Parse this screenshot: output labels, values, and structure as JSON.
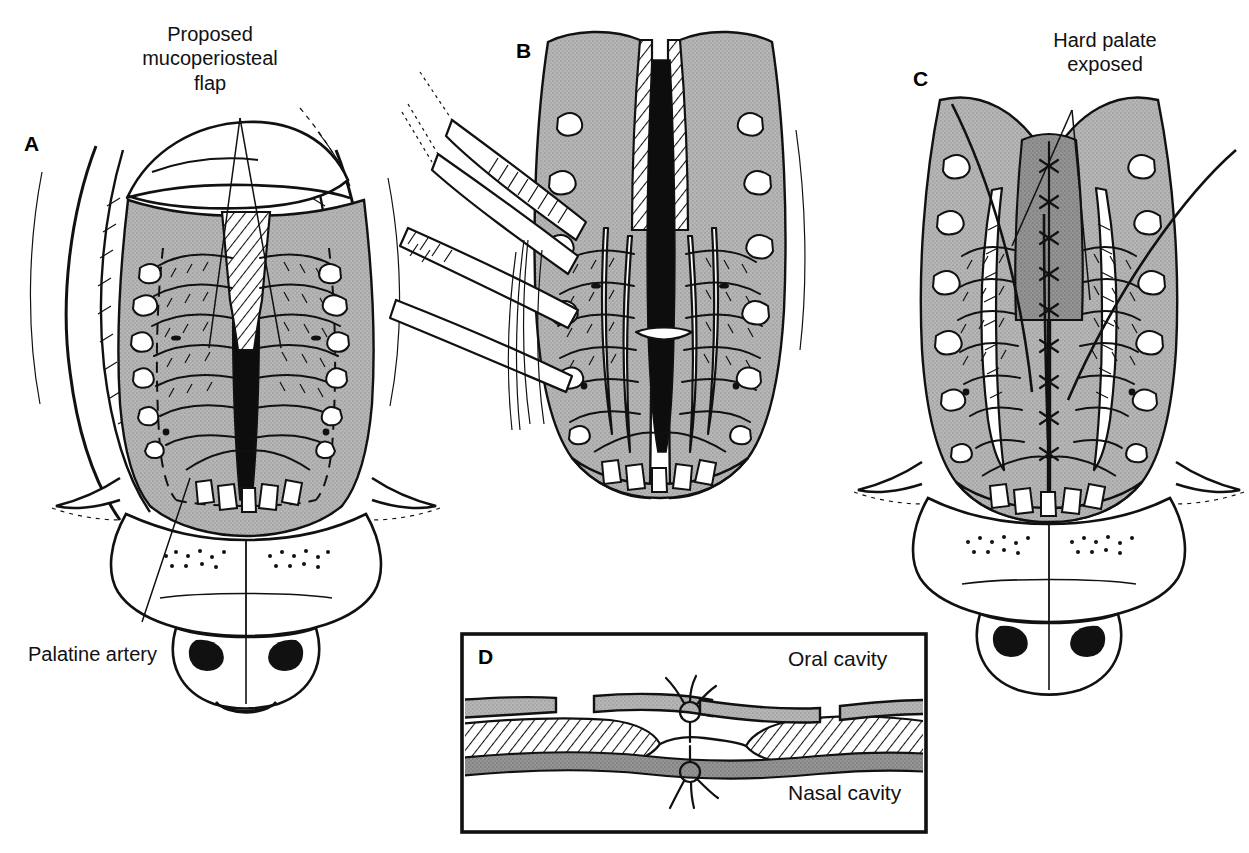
{
  "plate": {
    "width": 1249,
    "height": 853,
    "background": "#ffffff",
    "ink_color": "#111111",
    "mucosa_gray": "#b0b0b0",
    "mucosa_dark_gray": "#8f8f8f",
    "subject": "Cleft palate repair — two-flap (von Langenbeck / Bardach) palatoplasty, four-stage surgical plate"
  },
  "panels": [
    {
      "id": "A",
      "letter": "A",
      "letter_x": 24,
      "letter_y": 133,
      "caption": "Incision design on the cleft palate",
      "callouts": [
        {
          "name": "proposed-mucoperiosteal-flap",
          "text": "Proposed\nmucoperiosteal\nflap",
          "x": 110,
          "y": 22,
          "width": 200,
          "align": "center"
        },
        {
          "name": "palatine-artery",
          "text": "Palatine artery",
          "x": 28,
          "y": 642,
          "width": 190,
          "align": "left"
        }
      ]
    },
    {
      "id": "B",
      "letter": "B",
      "letter_x": 516,
      "letter_y": 40,
      "caption": "Mucoperiosteal flaps elevated with periosteal elevators and forceps",
      "callouts": []
    },
    {
      "id": "C",
      "letter": "C",
      "letter_x": 913,
      "letter_y": 68,
      "caption": "Midline closure completed; lateral relaxing incisions leave hard palate exposed",
      "callouts": [
        {
          "name": "hard-palate-exposed",
          "text": "Hard palate\nexposed",
          "x": 1010,
          "y": 28,
          "width": 190,
          "align": "center"
        }
      ]
    },
    {
      "id": "D",
      "letter": "D",
      "letter_x": 478,
      "letter_y": 646,
      "caption": "Coronal cross-section of the repaired palate showing two-layer suture closure",
      "frame": {
        "x": 462,
        "y": 634,
        "width": 464,
        "height": 198
      },
      "callouts": [
        {
          "name": "oral-cavity",
          "text": "Oral cavity",
          "x": 788,
          "y": 648
        },
        {
          "name": "nasal-cavity",
          "text": "Nasal cavity",
          "x": 788,
          "y": 782
        }
      ]
    }
  ],
  "legend_terms": [
    "Proposed mucoperiosteal flap",
    "Palatine artery",
    "Hard palate exposed",
    "Oral cavity",
    "Nasal cavity"
  ]
}
